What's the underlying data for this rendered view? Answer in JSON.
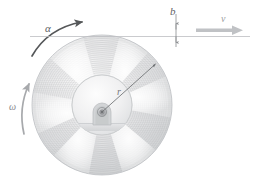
{
  "figure": {
    "background_color": "#ffffff",
    "width": 254,
    "height": 189
  },
  "labels": {
    "alpha": "α",
    "omega": "ω",
    "radius": "r",
    "offset": "b",
    "velocity": "v"
  },
  "colors": {
    "alpha_arrow": "#555759",
    "omega_arrow": "#aaacaf",
    "velocity_arrow": "#b9bbbe",
    "reference_line": "#b9bbbe",
    "dimension_line": "#8c8e91",
    "radius_line": "#6e7073",
    "disk_rim": "#c9cbcd",
    "disk_face_light": "#f2f2f3",
    "disk_face_mid": "#dcdddf",
    "disk_face_dark": "#c6c8ca",
    "hub_face": "#eeeff0",
    "hub_rim": "#c4c6c8",
    "axle": "#a9abae",
    "base_block": "#dddee0"
  },
  "geometry": {
    "disk_center_x": 102,
    "disk_center_y": 105,
    "disk_radius": 70,
    "hub_radius": 30,
    "reference_line_y": 36,
    "offset_b_top_y": 22,
    "offset_b_bottom_y": 44,
    "spoke_count": 8
  }
}
